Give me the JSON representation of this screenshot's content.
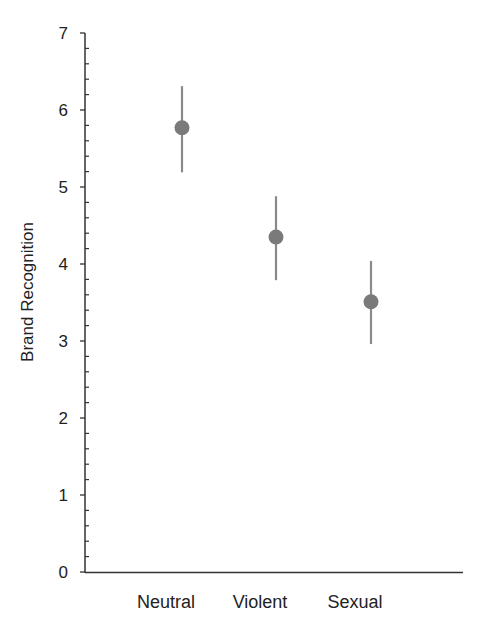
{
  "chart_data": {
    "type": "scatter",
    "subtype": "point-with-error-bars",
    "title": "",
    "xlabel": "",
    "ylabel": "Brand Recognition",
    "categories": [
      "Neutral",
      "Violent",
      "Sexual"
    ],
    "series": [
      {
        "name": "Brand Recognition",
        "values": [
          5.77,
          4.35,
          3.51
        ],
        "error_upper": [
          6.31,
          4.88,
          4.04
        ],
        "error_lower": [
          5.19,
          3.79,
          2.96
        ]
      }
    ],
    "ylim": [
      0,
      7
    ],
    "yticks": [
      0,
      1,
      2,
      3,
      4,
      5,
      6,
      7
    ],
    "minor_tick_step": 0.2,
    "grid": false,
    "legend": null,
    "colors": {
      "marker": "#7a7a7a",
      "error_bar": "#8a8a8a",
      "axis": "#333333",
      "text": "#222222"
    }
  },
  "labels": {
    "ylabel": "Brand Recognition",
    "categories": [
      "Neutral",
      "Violent",
      "Sexual"
    ],
    "yticks": [
      "0",
      "1",
      "2",
      "3",
      "4",
      "5",
      "6",
      "7"
    ]
  }
}
